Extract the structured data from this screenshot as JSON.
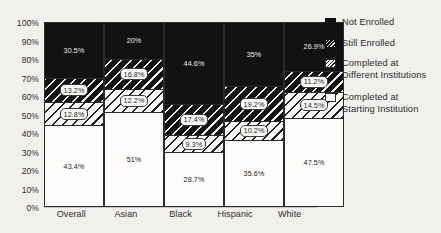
{
  "chart_data": {
    "type": "bar",
    "subtype": "stacked-percentage",
    "title": "",
    "xlabel": "",
    "ylabel": "",
    "ylim": [
      0,
      100
    ],
    "ytick_labels": [
      "100%",
      "90%",
      "80%",
      "70%",
      "60%",
      "50%",
      "40%",
      "30%",
      "20%",
      "10%",
      "0%"
    ],
    "ytick_values": [
      100,
      90,
      80,
      70,
      60,
      50,
      40,
      30,
      20,
      10,
      0
    ],
    "grid": true,
    "legend_position": "right",
    "categories": [
      "Overall",
      "Asian",
      "Black",
      "Hispanic",
      "White"
    ],
    "series": [
      {
        "name": "Completed at Starting Institution",
        "fill": "white",
        "values": [
          43.4,
          51,
          28.7,
          35.6,
          47.5
        ],
        "labels": [
          "43.4%",
          "51%",
          "28.7%",
          "35.6%",
          "47.5%"
        ]
      },
      {
        "name": "Completed at Different Institutions",
        "fill": "light-diagonal-hatch",
        "values": [
          12.8,
          12.2,
          9.3,
          10.2,
          14.5
        ],
        "labels": [
          "12.8%",
          "12.2%",
          "9.3%",
          "10.2%",
          "14.5%"
        ]
      },
      {
        "name": "Still Enrolled",
        "fill": "dark-diagonal-hatch",
        "values": [
          13.2,
          16.8,
          17.4,
          19.2,
          11.2
        ],
        "labels": [
          "13.2%",
          "16.8%",
          "17.4%",
          "19.2%",
          "11.2%"
        ]
      },
      {
        "name": "Not Enrolled",
        "fill": "solid-black",
        "values": [
          30.5,
          20,
          44.6,
          35,
          26.9
        ],
        "labels": [
          "30.5%",
          "20%",
          "44.6%",
          "35%",
          "26.9%"
        ]
      }
    ]
  },
  "legend": {
    "items": [
      {
        "label": "Not Enrolled",
        "swatch": "solid-black"
      },
      {
        "label": "Still Enrolled",
        "swatch": "dark-diagonal-hatch"
      },
      {
        "label": "Completed at\nDifferent Institutions",
        "swatch": "light-diagonal-hatch"
      },
      {
        "label": "Completed at\nStarting Institution",
        "swatch": "white"
      }
    ]
  },
  "colors": {
    "background": "#f2f0ed",
    "axis": "#2b2b2b",
    "gridline": "#c9c6c1",
    "dark_fill": "#121212",
    "light_fill": "#fdfcfa",
    "text": "#2b2b2b"
  }
}
